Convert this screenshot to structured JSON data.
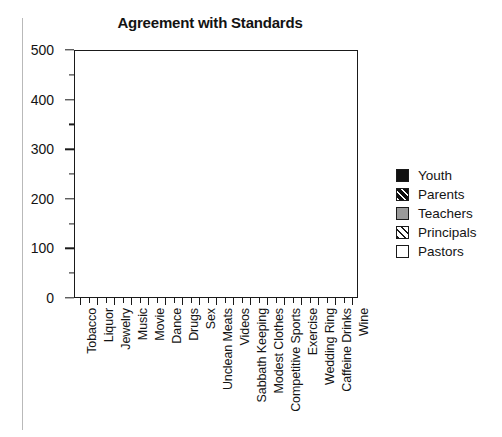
{
  "chart_data": {
    "type": "area",
    "stacked": true,
    "title": "Agreement with Standards",
    "xlabel": "",
    "ylabel": "",
    "ylim": [
      0,
      500
    ],
    "y_ticks": [
      0,
      100,
      200,
      300,
      400,
      500
    ],
    "y_minor_ticks": [
      50,
      150,
      250,
      350,
      450
    ],
    "grid": false,
    "legend_position": "right",
    "categories": [
      "Tobacco",
      "Liquor",
      "Jewelry",
      "Music",
      "Movie",
      "Dance",
      "Drugs",
      "Sex",
      "Unclean Meats",
      "Videos",
      "Sabbath Keeping",
      "Modest Clothes",
      "Competitive Sports",
      "Exercise",
      "Wedding Ring",
      "Caffeine Drinks",
      "Wine"
    ],
    "series": [
      {
        "name": "Youth",
        "fill": "#111111",
        "pattern": "solid",
        "values": [
          22,
          28,
          35,
          42,
          38,
          45,
          78,
          88,
          98,
          4,
          62,
          88,
          38,
          48,
          18,
          62,
          88
        ]
      },
      {
        "name": "Parents",
        "fill": "#111111",
        "pattern": "diagonal-white-on-black",
        "values": [
          164,
          158,
          72,
          62,
          30,
          38,
          92,
          80,
          68,
          6,
          128,
          88,
          38,
          138,
          30,
          30,
          62
        ]
      },
      {
        "name": "Teachers",
        "fill": "#9a9a9a",
        "pattern": "solid",
        "values": [
          98,
          72,
          60,
          68,
          48,
          54,
          100,
          92,
          96,
          6,
          98,
          82,
          36,
          68,
          26,
          40,
          62
        ]
      },
      {
        "name": "Principals",
        "fill": "#ffffff",
        "pattern": "diagonal-black-on-white",
        "values": [
          98,
          98,
          150,
          100,
          108,
          148,
          98,
          100,
          100,
          10,
          98,
          102,
          92,
          128,
          74,
          156,
          134
        ]
      },
      {
        "name": "Pastors",
        "fill": "#ffffff",
        "pattern": "solid",
        "values": [
          100,
          92,
          5,
          80,
          30,
          5,
          102,
          92,
          98,
          8,
          102,
          100,
          5,
          100,
          10,
          72,
          102
        ]
      }
    ],
    "totals": [
      482,
      448,
      322,
      352,
      254,
      290,
      470,
      452,
      460,
      34,
      488,
      460,
      209,
      482,
      158,
      360,
      448
    ]
  },
  "legend": {
    "items": [
      {
        "label": "Youth"
      },
      {
        "label": "Parents"
      },
      {
        "label": "Teachers"
      },
      {
        "label": "Principals"
      },
      {
        "label": "Pastors"
      }
    ]
  }
}
